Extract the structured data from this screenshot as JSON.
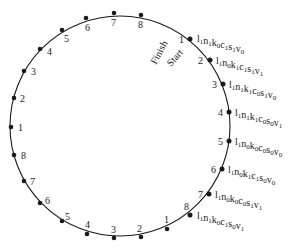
{
  "diagram": {
    "labels": {
      "start": "Start",
      "finish": "Finish"
    },
    "circle": {
      "cx": 120,
      "cy": 126,
      "r": 110,
      "stroke": "#1a1a1a"
    },
    "outer_points": [
      {
        "n": "2",
        "x": 14,
        "y": 98,
        "lx": 20,
        "ly": 102
      },
      {
        "n": "3",
        "x": 24,
        "y": 71,
        "lx": 31,
        "ly": 75
      },
      {
        "n": "4",
        "x": 40,
        "y": 49,
        "lx": 47,
        "ly": 55
      },
      {
        "n": "5",
        "x": 62,
        "y": 30,
        "lx": 64,
        "ly": 42
      },
      {
        "n": "6",
        "x": 86,
        "y": 18,
        "lx": 85,
        "ly": 31
      },
      {
        "n": "7",
        "x": 114,
        "y": 13,
        "lx": 111,
        "ly": 26
      },
      {
        "n": "8",
        "x": 141,
        "y": 15,
        "lx": 138,
        "ly": 28
      },
      {
        "n": "1",
        "x": 11,
        "y": 127,
        "lx": 18,
        "ly": 131
      },
      {
        "n": "8",
        "x": 14,
        "y": 155,
        "lx": 21,
        "ly": 159
      },
      {
        "n": "7",
        "x": 24,
        "y": 181,
        "lx": 30,
        "ly": 185
      },
      {
        "n": "6",
        "x": 40,
        "y": 203,
        "lx": 45,
        "ly": 204
      },
      {
        "n": "5",
        "x": 62,
        "y": 221,
        "lx": 65,
        "ly": 220
      },
      {
        "n": "4",
        "x": 87,
        "y": 234,
        "lx": 85,
        "ly": 228
      },
      {
        "n": "3",
        "x": 114,
        "y": 238,
        "lx": 111,
        "ly": 233
      },
      {
        "n": "2",
        "x": 141,
        "y": 237,
        "lx": 137,
        "ly": 232
      },
      {
        "n": "1",
        "x": 167,
        "y": 229,
        "lx": 164,
        "ly": 223
      }
    ],
    "states": [
      {
        "n": "1",
        "x": 190,
        "y": 39,
        "nx": 179,
        "ny": 43,
        "tx": 197,
        "ty": 42,
        "vars": [
          "l",
          "1",
          "n",
          "1",
          "k",
          "0",
          "c",
          "1",
          "s",
          "1",
          "v",
          "0"
        ]
      },
      {
        "n": "2",
        "x": 210,
        "y": 60,
        "nx": 198,
        "ny": 64,
        "tx": 216,
        "ty": 64,
        "vars": [
          "l",
          "1",
          "n",
          "0",
          "k",
          "1",
          "c",
          "1",
          "s",
          "1",
          "v",
          "1"
        ]
      },
      {
        "n": "3",
        "x": 223,
        "y": 84,
        "nx": 212,
        "ny": 88,
        "tx": 229,
        "ty": 88,
        "vars": [
          "l",
          "1",
          "n",
          "1",
          "k",
          "1",
          "c",
          "0",
          "s",
          "1",
          "v",
          "0"
        ]
      },
      {
        "n": "4",
        "x": 229,
        "y": 112,
        "nx": 218,
        "ny": 116,
        "tx": 235,
        "ty": 116,
        "vars": [
          "l",
          "1",
          "n",
          "1",
          "k",
          "1",
          "c",
          "0",
          "s",
          "0",
          "v",
          "1"
        ]
      },
      {
        "n": "5",
        "x": 229,
        "y": 141,
        "nx": 218,
        "ny": 145,
        "tx": 235,
        "ty": 145,
        "vars": [
          "l",
          "1",
          "n",
          "0",
          "k",
          "0",
          "c",
          "0",
          "s",
          "0",
          "v",
          "0"
        ]
      },
      {
        "n": "6",
        "x": 222,
        "y": 169,
        "nx": 211,
        "ny": 173,
        "tx": 228,
        "ty": 173,
        "vars": [
          "l",
          "1",
          "n",
          "0",
          "k",
          "1",
          "c",
          "1",
          "s",
          "0",
          "v",
          "0"
        ]
      },
      {
        "n": "7",
        "x": 209,
        "y": 194,
        "nx": 198,
        "ny": 198,
        "tx": 215,
        "ty": 198,
        "vars": [
          "l",
          "1",
          "n",
          "0",
          "k",
          "0",
          "c",
          "0",
          "s",
          "1",
          "v",
          "1"
        ]
      },
      {
        "n": "8",
        "x": 190,
        "y": 215,
        "nx": 184,
        "ny": 210,
        "tx": 197,
        "ty": 219,
        "vars": [
          "l",
          "1",
          "n",
          "1",
          "k",
          "0",
          "c",
          "1",
          "s",
          "0",
          "v",
          "1"
        ]
      }
    ]
  }
}
